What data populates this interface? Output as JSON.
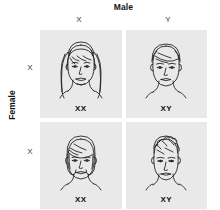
{
  "figure": {
    "name": "sex-determination-punnett-square",
    "top_axis_title": "Male",
    "left_axis_title": "Female",
    "column_headers": [
      "X",
      "Y"
    ],
    "row_headers": [
      "X",
      "X"
    ],
    "colors": {
      "cell_background": "#e9e9e9",
      "page_background": "#ffffff",
      "line_art": "#1a1a1a",
      "text": "#141414"
    }
  },
  "cells": [
    {
      "id": "cell-x-x",
      "row": 0,
      "col": 0,
      "genotype": "XX",
      "portrait": "girl-long-hair-face",
      "sex": "female"
    },
    {
      "id": "cell-x-y",
      "row": 0,
      "col": 1,
      "genotype": "XY",
      "portrait": "boy-short-hair-face",
      "sex": "male"
    },
    {
      "id": "cell-x-x-2",
      "row": 1,
      "col": 0,
      "genotype": "XX",
      "portrait": "girl-bob-hair-face",
      "sex": "female"
    },
    {
      "id": "cell-x-y-2",
      "row": 1,
      "col": 1,
      "genotype": "XY",
      "portrait": "boy-spiky-hair-face",
      "sex": "male"
    }
  ],
  "top_strip_text": ""
}
